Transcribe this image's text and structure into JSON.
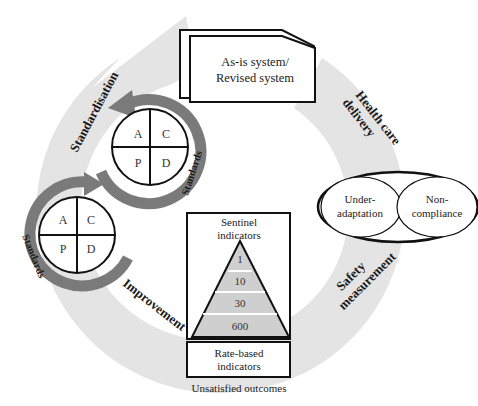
{
  "diagram": {
    "type": "cycle-diagram",
    "colors": {
      "outer_ring": "#e4e4e4",
      "pdca_ring": "#7a7a7a",
      "pyramid_fill": "#cfcfcf",
      "stroke": "#111111",
      "background": "#ffffff"
    },
    "cycle_stages": [
      {
        "id": "standardisation",
        "label": "Standardisation"
      },
      {
        "id": "health-care-delivery",
        "label_line1": "Health care",
        "label_line2": "delivery"
      },
      {
        "id": "safety-measurement",
        "label_line1": "Safety",
        "label_line2": "measurement"
      },
      {
        "id": "improvement",
        "label": "Improvement"
      }
    ],
    "system_box": {
      "line1": "As-is system/",
      "line2": "Revised system"
    },
    "pdca_cycles": [
      {
        "id": "upper",
        "cells": {
          "top_left": "A",
          "top_right": "C",
          "bottom_left": "P",
          "bottom_right": "D"
        },
        "ring_label": "Standards"
      },
      {
        "id": "lower",
        "cells": {
          "top_left": "A",
          "top_right": "C",
          "bottom_left": "P",
          "bottom_right": "D"
        },
        "ring_label": "Standards"
      }
    ],
    "deviation_ellipse": {
      "left": {
        "line1": "Under-",
        "line2": "adaptation"
      },
      "right": {
        "line1": "Non-",
        "line2": "compliance"
      }
    },
    "indicators": {
      "sentinel_line1": "Sentinel",
      "sentinel_line2": "indicators",
      "pyramid_levels": [
        "1",
        "10",
        "30",
        "600"
      ],
      "rate_based_line1": "Rate-based",
      "rate_based_line2": "indicators",
      "caption": "Unsatisfied outcomes"
    }
  }
}
